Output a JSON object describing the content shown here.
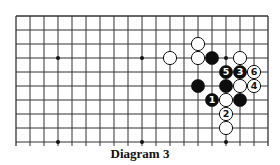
{
  "diagram": {
    "caption": "Diagram 3",
    "grid": {
      "cols": 19,
      "rows": 10,
      "origin_x": 16,
      "origin_y": 16,
      "spacing": 14,
      "bottom_edge_open": true,
      "line_color": "#333333"
    },
    "hoshi": [
      {
        "col": 3,
        "row": 3
      },
      {
        "col": 9,
        "row": 3
      },
      {
        "col": 15,
        "row": 3
      },
      {
        "col": 3,
        "row": 9
      },
      {
        "col": 9,
        "row": 9
      },
      {
        "col": 15,
        "row": 9
      }
    ],
    "stones": [
      {
        "color": "white",
        "col": 11,
        "row": 3,
        "label": ""
      },
      {
        "color": "white",
        "col": 13,
        "row": 2,
        "label": ""
      },
      {
        "color": "white",
        "col": 13,
        "row": 3,
        "label": ""
      },
      {
        "color": "black",
        "col": 14,
        "row": 3,
        "label": ""
      },
      {
        "color": "white",
        "col": 16,
        "row": 3,
        "label": ""
      },
      {
        "color": "black",
        "col": 15,
        "row": 4,
        "label": "5"
      },
      {
        "color": "black",
        "col": 16,
        "row": 4,
        "label": "3"
      },
      {
        "color": "white",
        "col": 17,
        "row": 4,
        "label": "6"
      },
      {
        "color": "black",
        "col": 13,
        "row": 5,
        "label": ""
      },
      {
        "color": "black",
        "col": 15,
        "row": 5,
        "label": ""
      },
      {
        "color": "white",
        "col": 16,
        "row": 5,
        "label": ""
      },
      {
        "color": "white",
        "col": 17,
        "row": 5,
        "label": "4"
      },
      {
        "color": "black",
        "col": 14,
        "row": 6,
        "label": "1"
      },
      {
        "color": "white",
        "col": 15,
        "row": 6,
        "label": ""
      },
      {
        "color": "black",
        "col": 16,
        "row": 6,
        "label": ""
      },
      {
        "color": "white",
        "col": 15,
        "row": 7,
        "label": "2"
      },
      {
        "color": "white",
        "col": 15,
        "row": 8,
        "label": ""
      }
    ]
  }
}
